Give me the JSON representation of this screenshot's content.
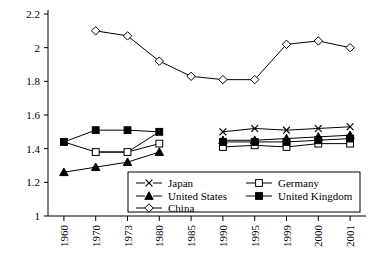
{
  "chart_data": {
    "type": "line",
    "title": "",
    "subtitle": "",
    "xlabel": "",
    "ylabel": "",
    "categories": [
      "1960",
      "1970",
      "1973",
      "1980",
      "1985",
      "1990",
      "1995",
      "1999",
      "2000",
      "2001"
    ],
    "ylim": [
      1,
      2.2
    ],
    "ytick_labels": [
      "1",
      "1.2",
      "1.4",
      "1.6",
      "1.8",
      "2",
      "2.2"
    ],
    "ytick_values": [
      1,
      1.2,
      1.4,
      1.6,
      1.8,
      2,
      2.2
    ],
    "grid": false,
    "legend_position": "inside-bottom-center",
    "series": [
      {
        "name": "Japan",
        "marker": "cross",
        "values": [
          1.44,
          1.38,
          1.38,
          1.5,
          null,
          1.5,
          1.52,
          1.51,
          1.52,
          1.53
        ]
      },
      {
        "name": "Germany",
        "marker": "open-square",
        "values": [
          null,
          1.38,
          1.38,
          1.43,
          null,
          1.41,
          1.42,
          1.41,
          1.43,
          1.43
        ]
      },
      {
        "name": "United States",
        "marker": "filled-triangle",
        "values": [
          1.26,
          1.29,
          1.32,
          1.38,
          null,
          1.45,
          1.45,
          1.46,
          1.47,
          1.48
        ]
      },
      {
        "name": "United Kingdom",
        "marker": "filled-square",
        "values": [
          1.44,
          1.51,
          1.51,
          1.5,
          null,
          1.44,
          1.44,
          1.44,
          1.45,
          1.46
        ]
      },
      {
        "name": "China",
        "marker": "open-diamond",
        "values": [
          null,
          2.1,
          2.07,
          1.92,
          1.83,
          1.81,
          1.81,
          2.02,
          2.04,
          2.0
        ]
      }
    ]
  },
  "legend": {
    "entries": [
      {
        "label": "Japan",
        "marker": "cross"
      },
      {
        "label": "Germany",
        "marker": "open-square"
      },
      {
        "label": "United States",
        "marker": "filled-triangle"
      },
      {
        "label": "United Kingdom",
        "marker": "filled-square"
      },
      {
        "label": "China",
        "marker": "open-diamond"
      }
    ]
  }
}
